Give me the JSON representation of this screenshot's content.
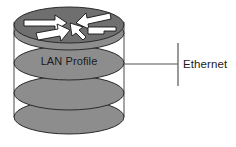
{
  "diagram": {
    "type": "network-topology",
    "title": "",
    "nodes": [
      {
        "id": "lan-profile-stack",
        "label": "LAN Profile",
        "shape": "stacked-cylinder",
        "icon": "router-icon",
        "layers": 4,
        "fill_color": "#8d8d8d",
        "top_fill_color": "#6f6f6f",
        "stroke_color": "#2b2b2b"
      }
    ],
    "connections": [
      {
        "id": "ethernet-link",
        "from": "lan-profile-stack",
        "label": "Ethernet",
        "terminator": "vertical-bar",
        "line_color": "#555555"
      }
    ],
    "labels": {
      "lan_profile": "LAN Profile",
      "ethernet": "Ethernet"
    },
    "icons": {
      "router": "router-icon",
      "arrow_count": 4,
      "arrow_fill": "#ffffff",
      "arrow_stroke": "#1a1a1a"
    }
  }
}
